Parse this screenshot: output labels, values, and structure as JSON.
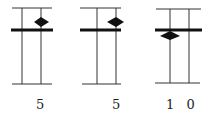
{
  "panels": [
    {
      "label": "5",
      "diamond_position": "above"
    },
    {
      "label": "5",
      "diamond_position": "above"
    },
    {
      "label": "1 0",
      "diamond_position": "below"
    }
  ],
  "colors": {
    "line": "#111111",
    "thin": "#333333"
  }
}
